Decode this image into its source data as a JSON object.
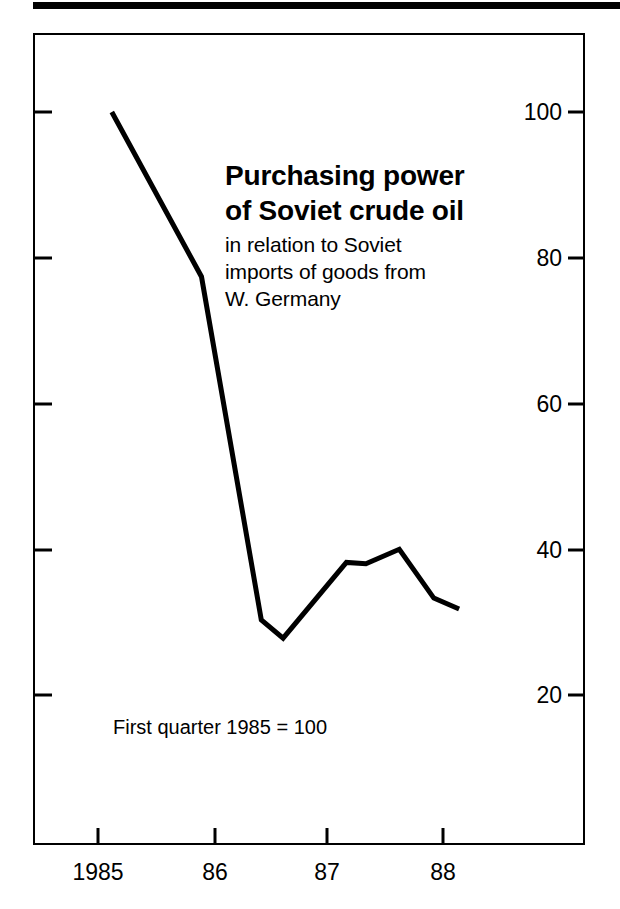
{
  "figure": {
    "title_lines": [
      "Purchasing power",
      "of Soviet crude oil"
    ],
    "subtitle_lines": [
      "in relation to Soviet",
      "imports of goods from",
      "W. Germany"
    ],
    "footnote": "First quarter 1985 = 100"
  },
  "chart_data": {
    "type": "line",
    "title": "Purchasing power of Soviet crude oil",
    "subtitle": "in relation to Soviet imports of goods from W. Germany",
    "annotation": "First quarter 1985 = 100",
    "xlabel": "",
    "ylabel": "",
    "xlim": [
      1984.85,
      1988.2
    ],
    "ylim": [
      8,
      112
    ],
    "grid": false,
    "legend": null,
    "y_ticks": [
      100,
      80,
      60,
      40,
      20
    ],
    "y_tick_labels": [
      "100",
      "80",
      "60",
      "40",
      "20"
    ],
    "y_tick_side": "right",
    "x_ticks": [
      1985,
      1986,
      1987,
      1988
    ],
    "x_tick_labels": [
      "1985",
      "86",
      "87",
      "88"
    ],
    "series": [
      {
        "name": "Purchasing power of Soviet crude oil",
        "color": "#000000",
        "x": [
          1985.12,
          1985.9,
          1986.42,
          1986.61,
          1987.16,
          1987.33,
          1987.62,
          1987.92,
          1988.14
        ],
        "values": [
          100,
          77.4,
          30.3,
          27.8,
          38.2,
          38.0,
          40.0,
          33.3,
          31.8
        ]
      }
    ]
  },
  "axes": {
    "y_ticks": [
      {
        "label": "100",
        "value": 100
      },
      {
        "label": "80",
        "value": 80
      },
      {
        "label": "60",
        "value": 60
      },
      {
        "label": "40",
        "value": 40
      },
      {
        "label": "20",
        "value": 20
      }
    ],
    "x_ticks": [
      {
        "label": "1985",
        "value": 1985
      },
      {
        "label": "86",
        "value": 1986
      },
      {
        "label": "87",
        "value": 1987
      },
      {
        "label": "88",
        "value": 1988
      }
    ]
  },
  "style": {
    "line_color": "#000000",
    "frame_color": "#000000",
    "background": "#ffffff"
  }
}
